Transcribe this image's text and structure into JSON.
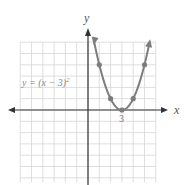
{
  "chart_data": {
    "type": "line",
    "title": "",
    "equation_label": "y = (x − 3)",
    "equation_exponent": "2",
    "xlabel": "x",
    "ylabel": "y",
    "xlim": [
      -6,
      6
    ],
    "ylim": [
      -6.4,
      6
    ],
    "grid": true,
    "tick_labels": [
      {
        "x": 3,
        "label": "3"
      }
    ],
    "series": [
      {
        "name": "y = (x − 3)^2",
        "color": "#7d7d7d",
        "curve": "parabola",
        "vertex": [
          3,
          0
        ],
        "points": [
          [
            1,
            4
          ],
          [
            2,
            1
          ],
          [
            3,
            0
          ],
          [
            4,
            1
          ],
          [
            5,
            4
          ]
        ],
        "arrows_both_ends": true
      }
    ]
  },
  "layout": {
    "origin_px": [
      88,
      110
    ],
    "unit_px": 11.3,
    "grid_color": "#d6d6d6",
    "axis_color": "#333333"
  }
}
